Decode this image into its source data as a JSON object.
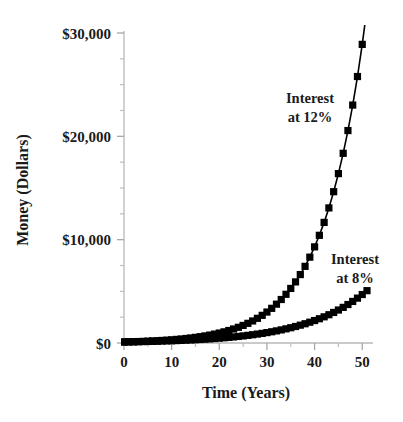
{
  "chart_data": {
    "type": "line",
    "title": "",
    "xlabel": "Time (Years)",
    "ylabel": "Money (Dollars)",
    "xlim": [
      0,
      51
    ],
    "ylim": [
      0,
      30000
    ],
    "grid": false,
    "legend_position": "inline-annotations",
    "x_ticks": [
      0,
      10,
      20,
      30,
      40,
      50
    ],
    "x_tick_labels": [
      "0",
      "10",
      "20",
      "30",
      "40",
      "50"
    ],
    "x_minor_tick_step": 5,
    "y_ticks": [
      0,
      10000,
      20000,
      30000
    ],
    "y_tick_labels": [
      "$0",
      "$10,000",
      "$20,000",
      "$30,000"
    ],
    "y_minor_tick_step": 2500,
    "marker": "filled-square",
    "series": [
      {
        "name": "Interest at 12%",
        "annotation": [
          "Interest",
          "at 12%"
        ],
        "rate_percent": 12,
        "principal": 100,
        "x": [
          0,
          1,
          2,
          3,
          4,
          5,
          6,
          7,
          8,
          9,
          10,
          11,
          12,
          13,
          14,
          15,
          16,
          17,
          18,
          19,
          20,
          21,
          22,
          23,
          24,
          25,
          26,
          27,
          28,
          29,
          30,
          31,
          32,
          33,
          34,
          35,
          36,
          37,
          38,
          39,
          40,
          41,
          42,
          43,
          44,
          45,
          46,
          47,
          48,
          49,
          50,
          51
        ],
        "values": [
          100,
          112,
          125,
          140,
          157,
          176,
          197,
          221,
          248,
          277,
          311,
          348,
          390,
          437,
          489,
          547,
          613,
          687,
          769,
          862,
          965,
          1081,
          1211,
          1356,
          1518,
          1700,
          1904,
          2133,
          2389,
          2676,
          2996,
          3355,
          3758,
          4209,
          4714,
          5280,
          5913,
          6623,
          7418,
          8307,
          9305,
          10421,
          11671,
          13072,
          14641,
          16393,
          18357,
          20559,
          23027,
          25787,
          28900,
          32400
        ]
      },
      {
        "name": "Interest at 8%",
        "annotation": [
          "Interest",
          "at 8%"
        ],
        "rate_percent": 8,
        "principal": 100,
        "x": [
          0,
          1,
          2,
          3,
          4,
          5,
          6,
          7,
          8,
          9,
          10,
          11,
          12,
          13,
          14,
          15,
          16,
          17,
          18,
          19,
          20,
          21,
          22,
          23,
          24,
          25,
          26,
          27,
          28,
          29,
          30,
          31,
          32,
          33,
          34,
          35,
          36,
          37,
          38,
          39,
          40,
          41,
          42,
          43,
          44,
          45,
          46,
          47,
          48,
          49,
          50,
          51
        ],
        "values": [
          100,
          108,
          117,
          126,
          136,
          147,
          159,
          171,
          185,
          200,
          216,
          233,
          252,
          272,
          294,
          317,
          343,
          370,
          400,
          431,
          466,
          503,
          543,
          587,
          634,
          685,
          740,
          799,
          863,
          932,
          1006,
          1087,
          1174,
          1268,
          1369,
          1479,
          1597,
          1725,
          1863,
          2012,
          2172,
          2346,
          2534,
          2736,
          2955,
          3192,
          3447,
          3723,
          4021,
          4342,
          4690,
          5065
        ]
      }
    ]
  }
}
